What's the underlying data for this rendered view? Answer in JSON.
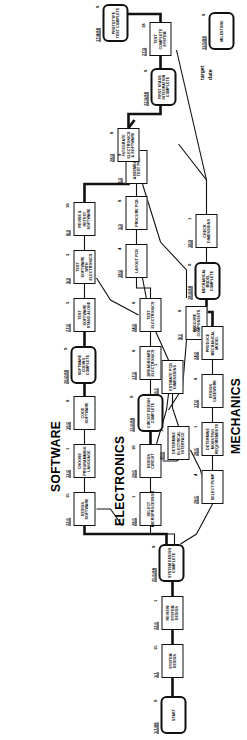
{
  "diagram": {
    "type": "pert-network-chart",
    "orientation": "rotated-90-ccw",
    "swimlanes": [
      {
        "name": "software-lane",
        "label": "SOFTWARE"
      },
      {
        "name": "electronics-lane",
        "label": "ELECTRONICS"
      },
      {
        "name": "mechanics-lane",
        "label": "MECHANICS"
      }
    ],
    "legend": {
      "target_date_label": "target\ndate",
      "milestone_label": "MILESTONE",
      "milestone_duration": "0",
      "milestone_date": "11/5/88"
    },
    "nodes": [
      {
        "id": "start",
        "label": "START",
        "kind": "event",
        "duration": "0",
        "date": "1/1/88"
      },
      {
        "id": "sysdesign",
        "label": "SYSTEM DESIGN",
        "kind": "activity",
        "duration": "15",
        "date": "1/1"
      },
      {
        "id": "reviewsys",
        "label": "REVIEW SYSTEM DESIGN",
        "kind": "activity",
        "duration": "1",
        "date": "22/1"
      },
      {
        "id": "sysdcomp",
        "label": "SYSTEM DESIGN COMPLETE",
        "kind": "event",
        "duration": "0",
        "date": "25/1/88"
      },
      {
        "id": "designsw",
        "label": "DESIGN SOFTWARE",
        "kind": "activity",
        "duration": "15",
        "date": "22/1"
      },
      {
        "id": "chooselang",
        "label": "CHOOSE PROGRAMMING LANGUAGE",
        "kind": "activity",
        "duration": "1",
        "date": "12/2"
      },
      {
        "id": "codesw",
        "label": "CODE SOFTWARE",
        "kind": "activity",
        "duration": "8",
        "date": "16/2"
      },
      {
        "id": "swcoding",
        "label": "SOFTWARE CODING COMPLETE",
        "kind": "event",
        "duration": "0",
        "date": "26/2/88"
      },
      {
        "id": "testswalone",
        "label": "TEST SOFTWARE STAND ALONE",
        "kind": "activity",
        "duration": "5",
        "date": "27/2"
      },
      {
        "id": "testswelec",
        "label": "TEST SOFTWARE WITH ELECTRONICS",
        "kind": "activity",
        "duration": "3",
        "date": "3/3"
      },
      {
        "id": "reviseswr",
        "label": "REVISE & RETEST SOFTWARE",
        "kind": "activity",
        "duration": "10",
        "date": "8/3"
      },
      {
        "id": "selectmicro",
        "label": "SELECT MICROPROCESSOR",
        "kind": "activity",
        "duration": "1",
        "date": "28/1"
      },
      {
        "id": "designckt",
        "label": "DESIGN CIRCUIT",
        "kind": "activity",
        "duration": "10",
        "date": "29/1"
      },
      {
        "id": "cktcomplete",
        "label": "CIRCUIT DESIGN COMPLETE",
        "kind": "event",
        "duration": "0",
        "date": "12/2/88"
      },
      {
        "id": "breadboard",
        "label": "BREADBOARD ELECTRONICS",
        "kind": "activity",
        "duration": "8",
        "date": "17/2"
      },
      {
        "id": "testelec",
        "label": "TEST ELECTRONICS",
        "kind": "activity",
        "duration": "8",
        "date": "24/2"
      },
      {
        "id": "layoutpcb",
        "label": "LAYOUT PCB",
        "kind": "activity",
        "duration": "4",
        "date": "18/2"
      },
      {
        "id": "procurepcb",
        "label": "PROCURE PCB",
        "kind": "activity",
        "duration": "8",
        "date": "1/3"
      },
      {
        "id": "assemblepcb",
        "label": "ASSEMBLE & TEST PCB",
        "kind": "activity",
        "duration": "9",
        "date": "2/3"
      },
      {
        "id": "integelecsw",
        "label": "INTEGRATE ELECTRONICS & SOFTWARE",
        "kind": "activity",
        "duration": "8",
        "date": "28/3"
      },
      {
        "id": "procurecomp",
        "label": "PROCURE COMPONENTS",
        "kind": "activity",
        "duration": "8",
        "date": "9/2"
      },
      {
        "id": "selectpump",
        "label": "SELECT PUMP",
        "kind": "activity",
        "duration": "4",
        "date": "28/1"
      },
      {
        "id": "detelecint",
        "label": "DETERMINE ELECTRICAL INTERFACE",
        "kind": "activity",
        "duration": "1",
        "date": "30/1"
      },
      {
        "id": "estpcbdim",
        "label": "ESTIMATE PCB DIMENSIONS",
        "kind": "activity",
        "duration": "1",
        "date": "2/2"
      },
      {
        "id": "detmount",
        "label": "DETERMINE MOUNTING REQUIREMENTS",
        "kind": "activity",
        "duration": "1",
        "date": "28/1"
      },
      {
        "id": "designcase",
        "label": "DESIGN CASEWORK",
        "kind": "activity",
        "duration": "8",
        "date": "17/2"
      },
      {
        "id": "prodmechmod",
        "label": "PRODUCE MECHANICAL MODEL",
        "kind": "activity",
        "duration": "10",
        "date": "24/2"
      },
      {
        "id": "mechmodcomp",
        "label": "MECHANICAL MODEL COMPLETE",
        "kind": "event",
        "duration": "0",
        "date": "18/3/88"
      },
      {
        "id": "checkdim",
        "label": "CHECK DIMENSIONS",
        "kind": "activity",
        "duration": "1",
        "date": "18/3"
      },
      {
        "id": "firststage",
        "label": "FIRST STAGE INTEGRATION COMPLETE",
        "kind": "event",
        "duration": "0",
        "date": "22/3/88"
      },
      {
        "id": "testcompsys",
        "label": "TEST COMPLETE SYSTEM",
        "kind": "activity",
        "duration": "18",
        "date": "27/3"
      },
      {
        "id": "prototest",
        "label": "PROTOTYPE TEST COMPLETE",
        "kind": "event",
        "duration": "0",
        "date": "17/4/88"
      }
    ]
  }
}
